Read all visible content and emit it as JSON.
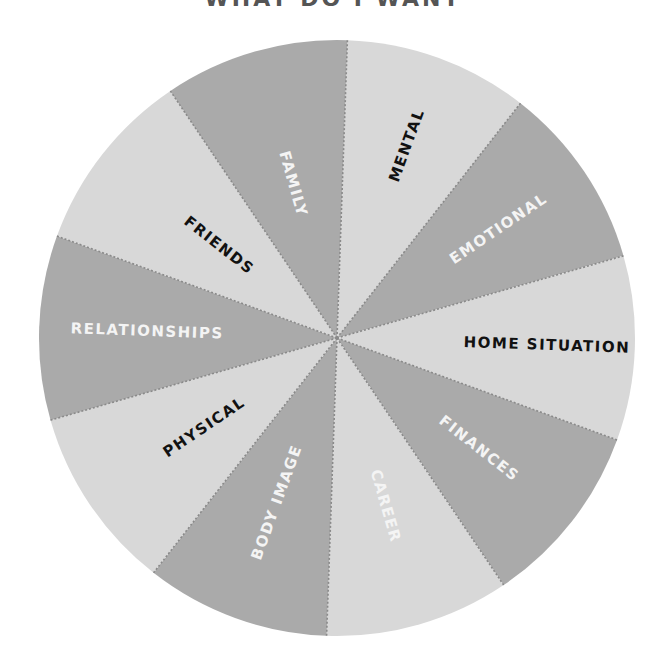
{
  "title": "WHAT DO I WANT",
  "colors": {
    "dark_segment": "#aaaaaa",
    "light_segment": "#d8d8d8",
    "divider": "#8a8a8a",
    "label_dark": "#111111",
    "label_light": "#f4f4f4",
    "background": "#ffffff"
  },
  "wheel": {
    "center": [
      337,
      338
    ],
    "radius": 298,
    "start_angle_deg": -88,
    "segment_span_deg": 36,
    "segments": [
      {
        "label": "MENTAL",
        "shade": "light",
        "text_color": "dark"
      },
      {
        "label": "EMOTIONAL",
        "shade": "dark",
        "text_color": "light"
      },
      {
        "label": "HOME SITUATION",
        "shade": "light",
        "text_color": "dark"
      },
      {
        "label": "FINANCES",
        "shade": "dark",
        "text_color": "light"
      },
      {
        "label": "CAREER",
        "shade": "light",
        "text_color": "light"
      },
      {
        "label": "BODY IMAGE",
        "shade": "dark",
        "text_color": "light"
      },
      {
        "label": "PHYSICAL",
        "shade": "light",
        "text_color": "dark"
      },
      {
        "label": "RELATIONSHIPS",
        "shade": "dark",
        "text_color": "light"
      },
      {
        "label": "FRIENDS",
        "shade": "light",
        "text_color": "dark"
      },
      {
        "label": "FAMILY",
        "shade": "dark",
        "text_color": "light"
      }
    ]
  }
}
